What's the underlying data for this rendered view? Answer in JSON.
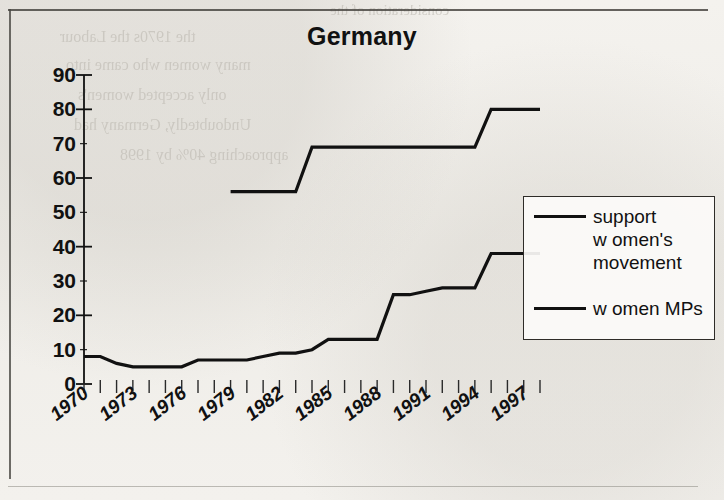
{
  "chart_data": {
    "type": "line",
    "title": "Germany",
    "xlabel": "",
    "ylabel": "",
    "xlim": [
      1970,
      1998
    ],
    "ylim": [
      0,
      90
    ],
    "ytick_step": 10,
    "yticks": [
      0,
      10,
      20,
      30,
      40,
      50,
      60,
      70,
      80,
      90
    ],
    "xticks": [
      1970,
      1971,
      1972,
      1973,
      1974,
      1975,
      1976,
      1977,
      1978,
      1979,
      1980,
      1981,
      1982,
      1983,
      1984,
      1985,
      1986,
      1987,
      1988,
      1989,
      1990,
      1991,
      1992,
      1993,
      1994,
      1995,
      1996,
      1997,
      1998
    ],
    "xticklabels": [
      "1970",
      "1973",
      "1976",
      "1979",
      "1982",
      "1985",
      "1988",
      "1991",
      "1994",
      "1997"
    ],
    "xticklabel_years": [
      1970,
      1973,
      1976,
      1979,
      1982,
      1985,
      1988,
      1991,
      1994,
      1997
    ],
    "grid": false,
    "legend_position": "center right",
    "line_color": "#111111",
    "series": [
      {
        "name": "support women's movement",
        "x": [
          1979,
          1980,
          1981,
          1982,
          1983,
          1984,
          1985,
          1986,
          1987,
          1988,
          1989,
          1990,
          1991,
          1992,
          1993,
          1994,
          1995,
          1996,
          1997,
          1998
        ],
        "values": [
          56,
          56,
          56,
          56,
          56,
          69,
          69,
          69,
          69,
          69,
          69,
          69,
          69,
          69,
          69,
          69,
          80,
          80,
          80,
          80
        ]
      },
      {
        "name": "women MPs",
        "x": [
          1970,
          1971,
          1972,
          1973,
          1974,
          1975,
          1976,
          1977,
          1978,
          1979,
          1980,
          1981,
          1982,
          1983,
          1984,
          1985,
          1986,
          1987,
          1988,
          1989,
          1990,
          1991,
          1992,
          1993,
          1994,
          1995,
          1996,
          1997,
          1998
        ],
        "values": [
          8,
          8,
          6,
          5,
          5,
          5,
          5,
          7,
          7,
          7,
          7,
          8,
          9,
          9,
          10,
          13,
          13,
          13,
          13,
          26,
          26,
          27,
          28,
          28,
          28,
          38,
          38,
          38,
          38
        ]
      }
    ]
  },
  "legend": {
    "entries": [
      {
        "label_lines": [
          "support",
          "w omen's",
          "movement"
        ]
      },
      {
        "label_lines": [
          "w omen MPs"
        ]
      }
    ]
  },
  "bleed_through": [
    "consideration of the",
    "the 1970s the Labour",
    "many women who came into",
    "only accepted women's",
    "Undoubtedly, Germany had",
    "approaching 40% by 1998"
  ]
}
